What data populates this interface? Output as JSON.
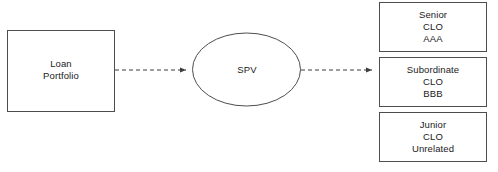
{
  "diagram": {
    "type": "securitization-flow-diagram",
    "background_color": "#ffffff",
    "stroke_color": "#4d4d4d",
    "text_color": "#1a1a1a",
    "nodes": {
      "loan_portfolio": {
        "shape": "rectangle",
        "lines": [
          "Loan",
          "Portfolio"
        ],
        "line1": "Loan",
        "line2": "Portfolio"
      },
      "spv": {
        "shape": "ellipse",
        "label": "SPV"
      },
      "senior_tranche": {
        "shape": "rectangle",
        "line1": "Senior",
        "line2": "CLO",
        "line3": "AAA"
      },
      "subordinate_tranche": {
        "shape": "rectangle",
        "line1": "Subordinate",
        "line2": "CLO",
        "line3": "BBB"
      },
      "junior_tranche": {
        "shape": "rectangle",
        "line1": "Junior",
        "line2": "CLO",
        "line3": "Unrelated"
      }
    },
    "connectors": [
      {
        "name": "portfolio-to-spv",
        "style": "dashed",
        "arrowhead": "filled-triangle",
        "from": "loan_portfolio",
        "to": "spv"
      },
      {
        "name": "spv-to-tranches",
        "style": "dashed",
        "arrowhead": "filled-triangle",
        "from": "spv",
        "to": "subordinate_tranche"
      }
    ]
  }
}
